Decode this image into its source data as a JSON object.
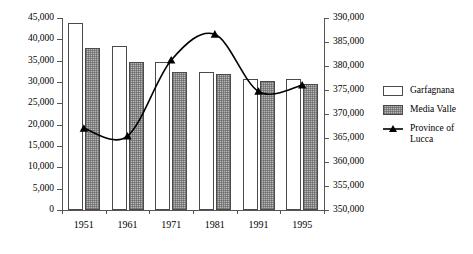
{
  "chart_data": {
    "type": "bar",
    "title": "",
    "xlabel": "",
    "ylabel": "",
    "categories": [
      "1951",
      "1961",
      "1971",
      "1981",
      "1991",
      "1995"
    ],
    "grid": false,
    "legend_position": "right",
    "left_axis": {
      "label": "",
      "ylim": [
        0,
        45000
      ],
      "ticks": [
        "0",
        "5,000",
        "10,000",
        "15,000",
        "20,000",
        "25,000",
        "30,000",
        "35,000",
        "40,000",
        "45,000"
      ],
      "tick_values": [
        0,
        5000,
        10000,
        15000,
        20000,
        25000,
        30000,
        35000,
        40000,
        45000
      ]
    },
    "right_axis": {
      "label": "",
      "ylim": [
        350000,
        390000
      ],
      "ticks": [
        "350,000",
        "355,000",
        "360,000",
        "365,000",
        "370,000",
        "375,000",
        "380,000",
        "385,000",
        "390,000"
      ],
      "tick_values": [
        350000,
        355000,
        360000,
        365000,
        370000,
        375000,
        380000,
        385000,
        390000
      ]
    },
    "series": [
      {
        "name": "Garfagnana",
        "kind": "bar",
        "axis": "left",
        "values": [
          43800,
          38500,
          34600,
          32300,
          30700,
          30600
        ]
      },
      {
        "name": "Media Valle",
        "kind": "bar",
        "axis": "left",
        "values": [
          38000,
          34600,
          32300,
          31900,
          30200,
          29600
        ]
      },
      {
        "name": "Province of Lucca",
        "kind": "line",
        "axis": "right",
        "values": [
          367000,
          365400,
          381200,
          386600,
          374700,
          376000
        ]
      }
    ]
  },
  "legend": {
    "items": [
      {
        "label": "Garfagnana",
        "type": "swatch-white"
      },
      {
        "label": "Media Valle",
        "type": "swatch-hatched"
      },
      {
        "label": "Province of\nLucca",
        "type": "line-marker"
      }
    ]
  }
}
